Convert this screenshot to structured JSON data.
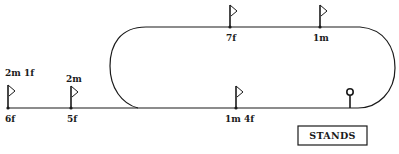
{
  "colors": {
    "line": "#1a1a1a",
    "background": "#ffffff"
  },
  "markers": [
    {
      "id": "2m1f-6f",
      "top_label": "2m 1f",
      "bottom_label": "6f",
      "position": "home-straight-extension"
    },
    {
      "id": "2m-5f",
      "top_label": "2m",
      "bottom_label": "5f",
      "position": "home-straight-extension"
    },
    {
      "id": "7f",
      "label": "7f",
      "position": "back-straight"
    },
    {
      "id": "1m",
      "label": "1m",
      "position": "back-straight"
    },
    {
      "id": "1m4f",
      "label": "1m 4f",
      "position": "home-straight"
    }
  ],
  "labels": {
    "m0_top": "2m 1f",
    "m0_bottom": "6f",
    "m1_top": "2m",
    "m1_bottom": "5f",
    "m2": "7f",
    "m3": "1m",
    "m4": "1m 4f",
    "stands": "STANDS"
  },
  "winning_post": {
    "label": "winning-post"
  }
}
